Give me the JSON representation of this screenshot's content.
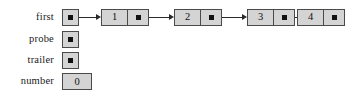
{
  "diagram": {
    "background_color": "#ffffff",
    "box_fill_color": "#d4d4d4",
    "box_border_color": "#4a4a4a",
    "arrow_color": "#2a2a2a",
    "dot_color": "#111111"
  },
  "variables": [
    {
      "label": "first",
      "kind": "pointer",
      "icon": "pointer-dot-icon",
      "points_to": "node-1"
    },
    {
      "label": "probe",
      "kind": "pointer",
      "icon": "pointer-dot-icon",
      "points_to": null
    },
    {
      "label": "trailer",
      "kind": "pointer",
      "icon": "pointer-dot-icon",
      "points_to": null
    },
    {
      "label": "number",
      "kind": "value",
      "value": "0"
    }
  ],
  "nodes": [
    {
      "value": "1",
      "next_icon": "pointer-dot-icon",
      "has_outgoing_arrow": true
    },
    {
      "value": "2",
      "next_icon": "pointer-dot-icon",
      "has_outgoing_arrow": true
    },
    {
      "value": "3",
      "next_icon": "pointer-dot-icon",
      "has_outgoing_arrow": true
    },
    {
      "value": "4",
      "next_icon": "pointer-dot-icon",
      "has_outgoing_arrow": false
    }
  ]
}
